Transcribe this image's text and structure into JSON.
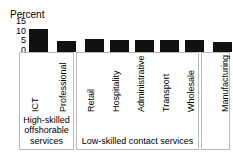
{
  "chart_data": {
    "type": "bar",
    "title": "",
    "subtitle": "",
    "xlabel": "",
    "ylabel": "Percent",
    "ylim": [
      0,
      15
    ],
    "yticks": [
      15,
      10,
      5,
      0
    ],
    "grid": false,
    "legend": null,
    "bar_color": "#111111",
    "categories": [
      "ICT",
      "Professional",
      "Retail",
      "Hospitality",
      "Administrative",
      "Transport",
      "Wholesale",
      "Manufacturing"
    ],
    "values": [
      11,
      5.5,
      6.5,
      6,
      6,
      6,
      6,
      5
    ],
    "groups": [
      {
        "label": "High-skilled offshorable services",
        "categories": [
          "ICT",
          "Professional"
        ]
      },
      {
        "label": "Low-skilled contact services",
        "categories": [
          "Retail",
          "Hospitality",
          "Administrative",
          "Transport",
          "Wholesale"
        ]
      },
      {
        "label": "",
        "categories": [
          "Manufacturing"
        ]
      }
    ]
  },
  "axis": {
    "title": "Percent",
    "ticks": [
      "15",
      "10",
      "5",
      "0"
    ]
  },
  "bars": [
    {
      "label": "ICT",
      "value": 11
    },
    {
      "label": "Professional",
      "value": 5.5
    },
    {
      "label": "Retail",
      "value": 6.5
    },
    {
      "label": "Hospitality",
      "value": 6
    },
    {
      "label": "Administrative",
      "value": 6
    },
    {
      "label": "Transport",
      "value": 6
    },
    {
      "label": "Wholesale",
      "value": 6
    },
    {
      "label": "Manufacturing",
      "value": 5
    }
  ],
  "groups": [
    {
      "caption": "High-skilled offshorable services"
    },
    {
      "caption": "Low-skilled contact services"
    },
    {
      "caption": ""
    }
  ]
}
